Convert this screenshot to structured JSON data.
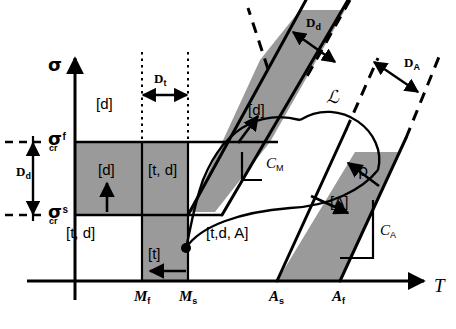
{
  "figure": {
    "background_color": "#ffffff",
    "shade_color": "#9a9a9a",
    "line_color": "#000000"
  },
  "axes": {
    "y_label": "σ",
    "y_label_name": "sigma-stress-axis-label",
    "x_label": "T",
    "x_label_name": "temperature-axis-label"
  },
  "stress_levels": [
    {
      "key": "sigma_cr_f",
      "symbol": "σ",
      "subscript": "cr",
      "superscript": "f",
      "y": 142
    },
    {
      "key": "sigma_cr_s",
      "symbol": "σ",
      "subscript": "cr",
      "superscript": "s",
      "y": 215
    }
  ],
  "temperature_ticks": [
    {
      "key": "Mf",
      "symbol": "M",
      "subscript": "f",
      "x": 142
    },
    {
      "key": "Ms",
      "symbol": "M",
      "subscript": "s",
      "x": 188
    },
    {
      "key": "As",
      "symbol": "A",
      "subscript": "s",
      "x": 277
    },
    {
      "key": "Af",
      "symbol": "A",
      "subscript": "f",
      "x": 340
    }
  ],
  "dimensions": [
    {
      "key": "Dt",
      "symbol": "D",
      "subscript": "t",
      "label_x": 158,
      "label_y": 78
    },
    {
      "key": "Dd_vertical",
      "symbol": "D",
      "subscript": "d",
      "label_x": 22,
      "label_y": 170
    },
    {
      "key": "Dd_diagonal",
      "symbol": "D",
      "subscript": "d",
      "label_x": 310,
      "label_y": 22
    },
    {
      "key": "DA_diagonal",
      "symbol": "D",
      "subscript": "A",
      "label_x": 408,
      "label_y": 62
    }
  ],
  "region_labels": [
    {
      "key": "d_upper_left",
      "text": "[d]",
      "x": 96,
      "y": 104
    },
    {
      "key": "d_box_left",
      "text": "[d]",
      "x": 99,
      "y": 170
    },
    {
      "key": "td_box_right",
      "text": "[t, d]",
      "x": 152,
      "y": 170
    },
    {
      "key": "td_lower_left",
      "text": "[t, d]",
      "x": 68,
      "y": 233
    },
    {
      "key": "t_lower",
      "text": "[t]",
      "x": 152,
      "y": 254
    },
    {
      "key": "tdA_center",
      "text": "[t,d, A]",
      "x": 208,
      "y": 233
    },
    {
      "key": "d_martensite_band",
      "text": "[d]",
      "x": 252,
      "y": 110
    },
    {
      "key": "A_austenite_band",
      "text": "[A]",
      "x": 335,
      "y": 202
    }
  ],
  "slope_labels": [
    {
      "key": "CM",
      "symbol": "C",
      "subscript": "M",
      "x": 261,
      "y": 161
    },
    {
      "key": "CA",
      "symbol": "C",
      "subscript": "A",
      "x": 382,
      "y": 230
    }
  ],
  "curve_labels": [
    {
      "key": "scriptL",
      "text": "ℒ",
      "x": 330,
      "y": 96
    },
    {
      "key": "rho",
      "text": "ρ",
      "x": 362,
      "y": 172
    }
  ]
}
